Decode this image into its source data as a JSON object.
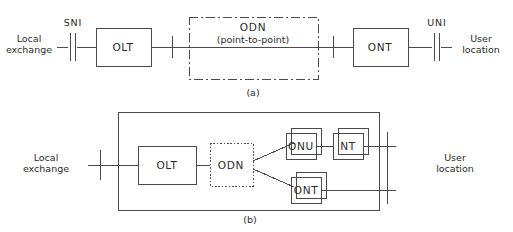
{
  "figure": {
    "stroke_color": "#4a4a4a",
    "text_color": "#2b2b2b",
    "background": "#ffffff"
  },
  "panel_a": {
    "caption": "(a)",
    "left_label_line1": "Local",
    "left_label_line2": "exchange",
    "right_label_line1": "User",
    "right_label_line2": "location",
    "reference_points": [
      {
        "name": "SNI",
        "label": "SNI",
        "style": "double-tick"
      },
      {
        "name": "UNI",
        "label": "UNI",
        "style": "double-tick"
      }
    ],
    "nodes": [
      {
        "name": "OLT",
        "label": "OLT",
        "border": "solid"
      },
      {
        "name": "ODN",
        "label": "ODN",
        "sublabel": "(point-to-point)",
        "border": "dash-dot"
      },
      {
        "name": "ONT",
        "label": "ONT",
        "border": "solid"
      }
    ]
  },
  "panel_b": {
    "caption": "(b)",
    "left_label_line1": "Local",
    "left_label_line2": "exchange",
    "right_label_line1": "User",
    "right_label_line2": "location",
    "nodes": [
      {
        "name": "OLT",
        "label": "OLT",
        "border": "solid",
        "stacked": false
      },
      {
        "name": "ODN",
        "label": "ODN",
        "border": "dotted",
        "stacked": false
      },
      {
        "name": "ONU",
        "label": "ONU",
        "border": "solid",
        "stacked": true
      },
      {
        "name": "NT",
        "label": "NT",
        "border": "solid",
        "stacked": true
      },
      {
        "name": "ONT",
        "label": "ONT",
        "border": "solid",
        "stacked": true
      }
    ]
  }
}
